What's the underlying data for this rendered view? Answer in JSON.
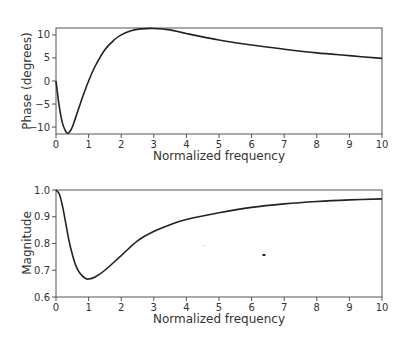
{
  "chart_data": [
    {
      "type": "line",
      "title": "",
      "xlabel": "Normalized frequency",
      "ylabel": "Phase (degrees)",
      "xlim": [
        0,
        10
      ],
      "ylim": [
        -11.5,
        11.5
      ],
      "xticks": [
        0,
        1,
        2,
        3,
        4,
        5,
        6,
        7,
        8,
        9,
        10
      ],
      "yticks": [
        10,
        5,
        0,
        -5,
        -10
      ],
      "grid": false,
      "legend": null,
      "series": [
        {
          "name": "Phase",
          "x": [
            0,
            0.1,
            0.2,
            0.3,
            0.35,
            0.4,
            0.5,
            0.6,
            0.8,
            1.0,
            1.2,
            1.5,
            1.8,
            2.0,
            2.3,
            2.6,
            3.0,
            3.5,
            4.0,
            5.0,
            6.0,
            7.0,
            8.0,
            9.0,
            10.0
          ],
          "values": [
            0,
            -5.5,
            -9.2,
            -11.0,
            -11.3,
            -11.2,
            -10.0,
            -8.0,
            -3.8,
            0.0,
            3.2,
            6.8,
            9.0,
            10.0,
            10.9,
            11.3,
            11.4,
            11.1,
            10.3,
            8.9,
            7.8,
            6.9,
            6.1,
            5.5,
            4.9
          ]
        }
      ]
    },
    {
      "type": "line",
      "title": "",
      "xlabel": "Normalized frequency",
      "ylabel": "Magnitude",
      "xlim": [
        0,
        10
      ],
      "ylim": [
        0.6,
        1.0
      ],
      "xticks": [
        0,
        1,
        2,
        3,
        4,
        5,
        6,
        7,
        8,
        9,
        10
      ],
      "yticks": [
        1.0,
        0.9,
        0.8,
        0.7,
        0.6
      ],
      "grid": false,
      "legend": null,
      "series": [
        {
          "name": "Magnitude",
          "x": [
            0,
            0.1,
            0.2,
            0.3,
            0.4,
            0.5,
            0.6,
            0.7,
            0.8,
            0.9,
            1.0,
            1.2,
            1.5,
            2.0,
            2.5,
            3.0,
            3.5,
            4.0,
            5.0,
            6.0,
            7.0,
            8.0,
            9.0,
            10.0
          ],
          "values": [
            1.0,
            0.985,
            0.94,
            0.875,
            0.81,
            0.76,
            0.72,
            0.695,
            0.68,
            0.67,
            0.667,
            0.675,
            0.7,
            0.755,
            0.81,
            0.845,
            0.87,
            0.89,
            0.915,
            0.935,
            0.948,
            0.957,
            0.963,
            0.967
          ]
        }
      ]
    }
  ],
  "figure": {
    "panels": [
      {
        "ylabel": "Phase (degrees)",
        "xlabel": "Normalized frequency"
      },
      {
        "ylabel": "Magnitude",
        "xlabel": "Normalized frequency"
      }
    ],
    "tick_labels": {
      "x": [
        "0",
        "1",
        "2",
        "3",
        "4",
        "5",
        "6",
        "7",
        "8",
        "9",
        "10"
      ],
      "phase_y": [
        "10",
        "5",
        "0",
        "−5",
        "−10"
      ],
      "magnitude_y": [
        "1.0",
        "0.9",
        "0.8",
        "0.7",
        "0.6"
      ]
    },
    "colors": {
      "curve": "#222222",
      "frame": "#555555",
      "text": "#333333"
    }
  }
}
